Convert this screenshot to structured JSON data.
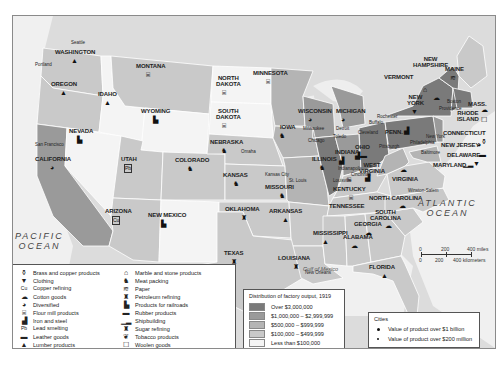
{
  "map": {
    "title_note": "Distribution of factory output, 1919",
    "oceans": [
      {
        "id": "pacific",
        "label_line1": "PACIFIC",
        "label_line2": "OCEAN"
      },
      {
        "id": "atlantic",
        "label_line1": "ATLANTIC",
        "label_line2": "OCEAN"
      }
    ],
    "gulf_label": "Gulf of Mexico",
    "states": [
      {
        "name": "WASHINGTON",
        "category": "$100,000 – $499,999",
        "product": "Lumber products"
      },
      {
        "name": "OREGON",
        "category": "$100,000 – $499,999",
        "product": "Lumber products"
      },
      {
        "name": "CALIFORNIA",
        "category": "$1,000,000 – $2,999,999",
        "product": "Diversified"
      },
      {
        "name": "IDAHO",
        "category": "Less than $100,000",
        "product": "Lumber products"
      },
      {
        "name": "NEVADA",
        "category": "Less than $100,000",
        "product": "Products for railroads"
      },
      {
        "name": "MONTANA",
        "category": "$100,000 – $499,999",
        "product": "Flour mill products"
      },
      {
        "name": "WYOMING",
        "category": "Less than $100,000",
        "product": "Products for railroads"
      },
      {
        "name": "UTAH",
        "category": "$100,000 – $499,999",
        "product": "Lead smelting"
      },
      {
        "name": "ARIZONA",
        "category": "$100,000 – $499,999",
        "product": "Copper refining"
      },
      {
        "name": "COLORADO",
        "category": "$100,000 – $499,999",
        "product": "Meat packing"
      },
      {
        "name": "NEW MEXICO",
        "category": "Less than $100,000",
        "product": "Products for railroads"
      },
      {
        "name": "NORTH DAKOTA",
        "category": "Less than $100,000",
        "product": "Flour mill products"
      },
      {
        "name": "SOUTH DAKOTA",
        "category": "Less than $100,000",
        "product": "Flour mill products"
      },
      {
        "name": "NEBRASKA",
        "category": "$100,000 – $499,999",
        "product": "Meat packing"
      },
      {
        "name": "KANSAS",
        "category": "$100,000 – $499,999",
        "product": "Meat packing"
      },
      {
        "name": "OKLAHOMA",
        "category": "$100,000 – $499,999",
        "product": "Petroleum refining"
      },
      {
        "name": "TEXAS",
        "category": "$100,000 – $499,999",
        "product": "Petroleum refining"
      },
      {
        "name": "MINNESOTA",
        "category": "$500,000 – $999,999",
        "product": "Flour mill products"
      },
      {
        "name": "IOWA",
        "category": "$500,000 – $999,999",
        "product": "Meat packing"
      },
      {
        "name": "MISSOURI",
        "category": "$500,000 – $999,999",
        "product": "Meat packing"
      },
      {
        "name": "ARKANSAS",
        "category": "$100,000 – $499,999",
        "product": "Lumber products"
      },
      {
        "name": "LOUISIANA",
        "category": "$100,000 – $499,999",
        "product": "Sugar refining"
      },
      {
        "name": "WISCONSIN",
        "category": "$1,000,000 – $2,999,999",
        "product": "Diversified"
      },
      {
        "name": "ILLINOIS",
        "category": "Over $3,000,000",
        "product": "Meat packing"
      },
      {
        "name": "MICHIGAN",
        "category": "$1,000,000 – $2,999,999",
        "product": "Diversified"
      },
      {
        "name": "INDIANA",
        "category": "$1,000,000 – $2,999,999",
        "product": "Iron and steel"
      },
      {
        "name": "OHIO",
        "category": "Over $3,000,000",
        "product": "Iron and steel"
      },
      {
        "name": "KENTUCKY",
        "category": "$100,000 – $499,999",
        "product": "Flour mill products"
      },
      {
        "name": "TENNESSEE",
        "category": "$100,000 – $499,999",
        "product": "Flour mill products"
      },
      {
        "name": "MISSISSIPPI",
        "category": "$100,000 – $499,999",
        "product": "Lumber products"
      },
      {
        "name": "ALABAMA",
        "category": "$100,000 – $499,999",
        "product": "Cotton goods"
      },
      {
        "name": "GEORGIA",
        "category": "$100,000 – $499,999",
        "product": "Cotton goods"
      },
      {
        "name": "FLORIDA",
        "category": "$100,000 – $499,999",
        "product": "Lumber products"
      },
      {
        "name": "SOUTH CAROLINA",
        "category": "$100,000 – $499,999",
        "product": "Cotton goods"
      },
      {
        "name": "NORTH CAROLINA",
        "category": "$100,000 – $499,999",
        "product": "Cotton goods"
      },
      {
        "name": "VIRGINIA",
        "category": "$100,000 – $499,999",
        "product": "Cotton goods"
      },
      {
        "name": "WEST VIRGINIA",
        "category": "$500,000 – $999,999",
        "product": "Iron and steel"
      },
      {
        "name": "PENN.",
        "category": "Over $3,000,000",
        "product": "Iron and steel"
      },
      {
        "name": "NEW YORK",
        "category": "Over $3,000,000",
        "product": "Clothing"
      },
      {
        "name": "NEW JERSEY",
        "category": "$1,000,000 – $2,999,999",
        "product": "Diversified"
      },
      {
        "name": "DELAWARE",
        "category": "$100,000 – $499,999",
        "product": "Leather goods"
      },
      {
        "name": "MARYLAND",
        "category": "$500,000 – $999,999",
        "product": "Shipbuilding, Clothing"
      },
      {
        "name": "CONNECTICUT",
        "category": "$1,000,000 – $2,999,999",
        "product": "Brass and copper products"
      },
      {
        "name": "RHODE ISLAND",
        "category": "$500,000 – $999,999",
        "product": "Cotton goods, Woolen goods"
      },
      {
        "name": "MASS.",
        "category": "Over $3,000,000",
        "product": "Cotton goods"
      },
      {
        "name": "VERMONT",
        "category": "$100,000 – $499,999",
        "product": "Marble and stone products"
      },
      {
        "name": "NEW HAMPSHIRE",
        "category": "$100,000 – $499,999",
        "product": "Cotton goods"
      },
      {
        "name": "MAINE",
        "category": "$100,000 – $499,999",
        "product": "Paper"
      }
    ],
    "cities": [
      {
        "name": "Seattle",
        "size": "small"
      },
      {
        "name": "Portland",
        "size": "small"
      },
      {
        "name": "San Francisco",
        "size": "small"
      },
      {
        "name": "Omaha",
        "size": "small"
      },
      {
        "name": "Kansas City",
        "size": "small"
      },
      {
        "name": "St. Louis",
        "size": "large"
      },
      {
        "name": "Milwaukee",
        "size": "small"
      },
      {
        "name": "Chicago",
        "size": "large"
      },
      {
        "name": "Detroit",
        "size": "large"
      },
      {
        "name": "Toledo",
        "size": "small"
      },
      {
        "name": "Cleveland",
        "size": "large"
      },
      {
        "name": "Indianapolis",
        "size": "small"
      },
      {
        "name": "Cincinnati",
        "size": "small"
      },
      {
        "name": "Louisville",
        "size": "small"
      },
      {
        "name": "Buffalo",
        "size": "small"
      },
      {
        "name": "Rochester",
        "size": "small"
      },
      {
        "name": "Pittsburgh",
        "size": "large"
      },
      {
        "name": "Philadelphia",
        "size": "large"
      },
      {
        "name": "New York",
        "size": "large"
      },
      {
        "name": "Boston",
        "size": "large"
      },
      {
        "name": "Providence",
        "size": "small"
      },
      {
        "name": "Baltimore",
        "size": "small"
      },
      {
        "name": "Winston-Salem",
        "size": "small"
      },
      {
        "name": "New Orleans",
        "size": "small"
      }
    ],
    "labels": {
      "washington": "WASHINGTON",
      "oregon": "OREGON",
      "california": "CALIFORNIA",
      "idaho": "IDAHO",
      "nevada": "NEVADA",
      "montana": "MONTANA",
      "wyoming": "WYOMING",
      "utah": "UTAH",
      "arizona": "ARIZONA",
      "colorado": "COLORADO",
      "new_mexico": "NEW MEXICO",
      "north_dakota_1": "NORTH",
      "north_dakota_2": "DAKOTA",
      "south_dakota_1": "SOUTH",
      "south_dakota_2": "DAKOTA",
      "nebraska": "NEBRASKA",
      "kansas": "KANSAS",
      "oklahoma": "OKLAHOMA",
      "texas": "TEXAS",
      "minnesota": "MINNESOTA",
      "iowa": "IOWA",
      "missouri": "MISSOURI",
      "arkansas": "ARKANSAS",
      "louisiana": "LOUISIANA",
      "wisconsin": "WISCONSIN",
      "illinois": "ILLINOIS",
      "michigan": "MICHIGAN",
      "indiana": "INDIANA",
      "ohio": "OHIO",
      "kentucky": "KENTUCKY",
      "tennessee": "TENNESSEE",
      "mississippi": "MISSISSIPPI",
      "alabama": "ALABAMA",
      "georgia": "GEORGIA",
      "florida": "FLORIDA",
      "south_carolina_1": "SOUTH",
      "south_carolina_2": "CAROLINA",
      "north_carolina": "NORTH CAROLINA",
      "virginia": "VIRGINIA",
      "west_virginia_1": "WEST",
      "west_virginia_2": "VIRGINIA",
      "penn": "PENN.",
      "new_york_1": "NEW",
      "new_york_2": "YORK",
      "new_jersey": "NEW JERSEY",
      "delaware": "DELAWARE",
      "maryland": "MARYLAND",
      "connecticut": "CONNECTICUT",
      "rhode_island_1": "RHODE",
      "rhode_island_2": "ISLAND",
      "mass": "MASS.",
      "vermont": "VERMONT",
      "new_hampshire_1": "NEW",
      "new_hampshire_2": "HAMPSHIRE",
      "maine": "MAINE"
    }
  },
  "product_legend": {
    "left": [
      {
        "icon": "brass-icon",
        "glyph": "⚱",
        "label": "Brass and copper products"
      },
      {
        "icon": "clothing-icon",
        "glyph": "👕",
        "label": "Clothing"
      },
      {
        "icon": "copper-icon",
        "glyph": "Cu",
        "label": "Copper refining"
      },
      {
        "icon": "cotton-icon",
        "glyph": "☁",
        "label": "Cotton goods"
      },
      {
        "icon": "diversified-icon",
        "glyph": "◕",
        "label": "Diversified"
      },
      {
        "icon": "flour-icon",
        "glyph": "⌸",
        "label": "Flour mill products"
      },
      {
        "icon": "iron-steel-icon",
        "glyph": "▟",
        "label": "Iron and steel"
      },
      {
        "icon": "lead-icon",
        "glyph": "Pb",
        "label": "Lead smelting"
      },
      {
        "icon": "leather-icon",
        "glyph": "▬",
        "label": "Leather goods"
      },
      {
        "icon": "lumber-icon",
        "glyph": "▲",
        "label": "Lumber products"
      }
    ],
    "right": [
      {
        "icon": "marble-icon",
        "glyph": "🏛",
        "label": "Marble and stone products"
      },
      {
        "icon": "meat-icon",
        "glyph": "🐂",
        "label": "Meat packing"
      },
      {
        "icon": "paper-icon",
        "glyph": "≋",
        "label": "Paper"
      },
      {
        "icon": "petroleum-icon",
        "glyph": "⛽",
        "label": "Petroleum refining"
      },
      {
        "icon": "railroad-icon",
        "glyph": "🚂",
        "label": "Products for railroads"
      },
      {
        "icon": "rubber-icon",
        "glyph": "▬",
        "label": "Rubber products"
      },
      {
        "icon": "ship-icon",
        "glyph": "⛴",
        "label": "Shipbuilding"
      },
      {
        "icon": "sugar-icon",
        "glyph": "♜",
        "label": "Sugar refining"
      },
      {
        "icon": "tobacco-icon",
        "glyph": "🍃",
        "label": "Tobacco products"
      },
      {
        "icon": "woolen-icon",
        "glyph": "🐑",
        "label": "Woolen goods"
      }
    ]
  },
  "output_legend": {
    "title": "Distribution of factory output, 1919",
    "items": [
      {
        "label": "Over $3,000,000",
        "color": "#7a7a7a"
      },
      {
        "label": "$1,000,000 – $2,999,999",
        "color": "#9a9a9a"
      },
      {
        "label": "$500,000 – $999,999",
        "color": "#b4b4b4"
      },
      {
        "label": "$100,000 – $499,999",
        "color": "#c9c9c9"
      },
      {
        "label": "Less than $100,000",
        "color": "#f4f4f4"
      }
    ]
  },
  "cities_legend": {
    "title": "Cities",
    "items": [
      {
        "label": "Value of product over $1 billion",
        "marker": "large-dot"
      },
      {
        "label": "Value of product over $200 million",
        "marker": "small-dot"
      }
    ]
  },
  "scale": {
    "miles": [
      "0",
      "200",
      "400 miles"
    ],
    "km": [
      "0",
      "200",
      "400 kilometers"
    ]
  }
}
